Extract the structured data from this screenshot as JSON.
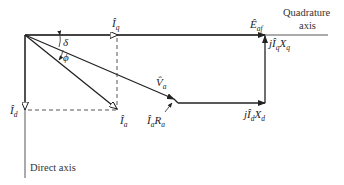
{
  "diagram": {
    "axes": {
      "quadrature_label_line1": "Quadrature",
      "quadrature_label_line2": "axis",
      "direct_label": "Direct axis"
    },
    "angles": {
      "delta": "δ",
      "phi": "ϕ"
    },
    "phasors": {
      "Iq": {
        "base": "Î",
        "sub": "q"
      },
      "Id": {
        "base": "Î",
        "sub": "d"
      },
      "Ia": {
        "base": "Î",
        "sub": "a"
      },
      "Va": {
        "base": "V̂",
        "sub": "a"
      },
      "Eaf": {
        "base": "Ê",
        "sub": "af"
      },
      "IaRa": {
        "base": "Î",
        "sub": "a",
        "tail": "R",
        "tail_sub": "a"
      },
      "jIdXd": {
        "prefix": "j",
        "base": "Î",
        "sub": "d",
        "tail": "X",
        "tail_sub": "d"
      },
      "jIqXq": {
        "prefix": "j",
        "base": "Î",
        "sub": "q",
        "tail": "X",
        "tail_sub": "q"
      }
    },
    "colors": {
      "stroke": "#222222",
      "background": "#ffffff"
    }
  }
}
